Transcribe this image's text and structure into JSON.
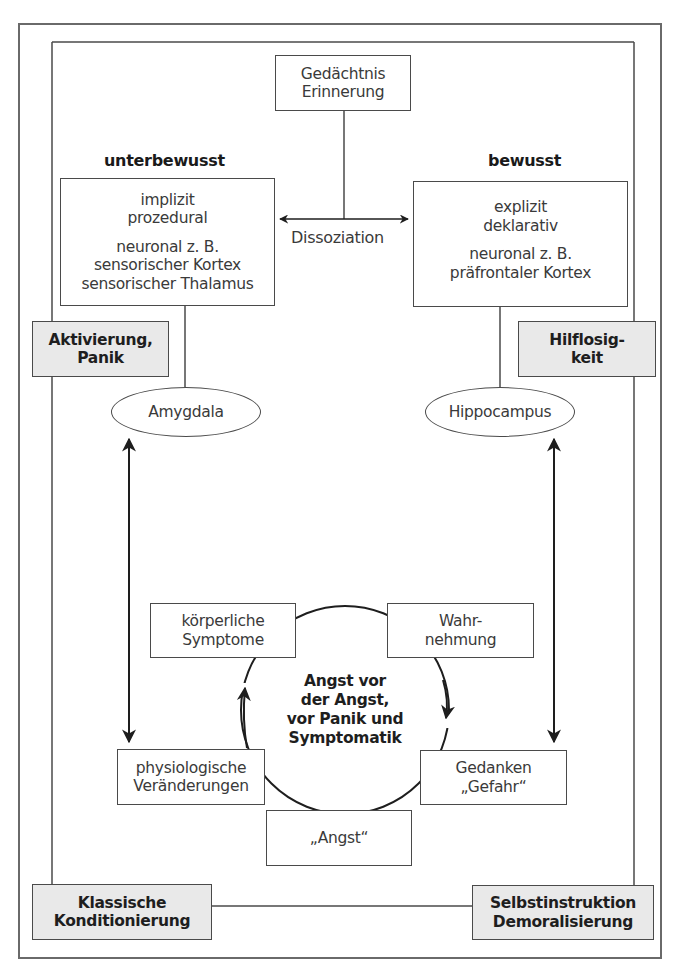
{
  "diagram": {
    "type": "flow-diagram",
    "headings": {
      "left": "unterbewusst",
      "right": "bewusst"
    },
    "memory_box": {
      "lines": [
        "Gedächtnis",
        "Erinnerung"
      ]
    },
    "dissociation_label": "Dissoziation",
    "left_box": {
      "lines": [
        "implizit",
        "prozedural",
        "",
        "neuronal z. B.",
        "sensorischer Kortex",
        "sensorischer Thalamus"
      ]
    },
    "right_box": {
      "lines": [
        "explizit",
        "deklarativ",
        "",
        "neuronal z. B.",
        "präfrontaler Kortex"
      ]
    },
    "side_boxes": {
      "left": {
        "lines": [
          "Aktivierung,",
          "Panik"
        ]
      },
      "right": {
        "lines": [
          "Hilflosig-",
          "keit"
        ]
      }
    },
    "ellipses": {
      "left": "Amygdala",
      "right": "Hippocampus"
    },
    "cycle": {
      "center": [
        "Angst vor",
        "der Angst,",
        "vor Panik und",
        "Symptomatik"
      ],
      "nodes": [
        {
          "id": "koerperliche",
          "lines": [
            "körperliche",
            "Symptome"
          ]
        },
        {
          "id": "wahrnehmung",
          "lines": [
            "Wahr-",
            "nehmung"
          ]
        },
        {
          "id": "gedanken",
          "lines": [
            "Gedanken",
            "„Gefahr“"
          ]
        },
        {
          "id": "angst",
          "lines": [
            "„Angst“"
          ]
        },
        {
          "id": "physiologische",
          "lines": [
            "physiologische",
            "Veränderungen"
          ]
        }
      ]
    },
    "bottom_boxes": {
      "left": {
        "lines": [
          "Klassische",
          "Konditionierung"
        ]
      },
      "right": {
        "lines": [
          "Selbstinstruktion",
          "Demoralisierung"
        ]
      }
    },
    "colors": {
      "stroke": "#4a4a4a",
      "gray_fill": "#e9e9e9",
      "arrow": "#1e1e1e"
    }
  }
}
